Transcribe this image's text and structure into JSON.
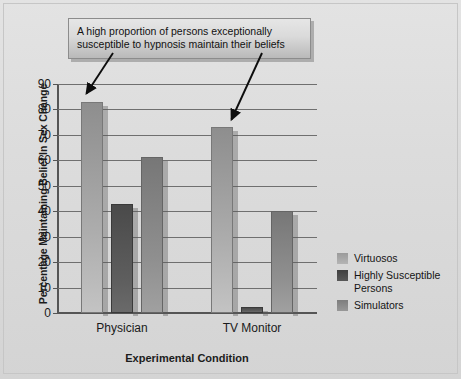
{
  "chart_data": {
    "type": "bar",
    "title": "",
    "categories": [
      "Physician",
      "TV Monitor"
    ],
    "series": [
      {
        "name": "Virtuosos",
        "values": [
          83,
          73
        ],
        "color": "#a8a8a8"
      },
      {
        "name": "Highly Susceptible Persons",
        "values": [
          43,
          2.5
        ],
        "color": "#4d4d4d"
      },
      {
        "name": "Simulators",
        "values": [
          61.5,
          40
        ],
        "color": "#8a8a8a"
      }
    ],
    "xlabel": "Experimental Condition",
    "ylabel": "Percentage Maintaining Belief In Sex Change",
    "ylim": [
      0,
      90
    ],
    "yticks": [
      0,
      10,
      20,
      30,
      40,
      50,
      60,
      70,
      80,
      90
    ],
    "ytick_labels": [
      "0",
      "10",
      "20",
      "30",
      "40",
      "50",
      "60",
      "70",
      "80",
      "90"
    ],
    "grid": true,
    "legend_position": "right",
    "annotations": [
      {
        "name": "callout",
        "lines": [
          "A high proportion of persons exceptionally",
          "susceptible to hypnosis maintain their beliefs"
        ],
        "points_to": [
          "Physician / Virtuosos",
          "TV Monitor / Virtuosos"
        ]
      }
    ]
  },
  "axes": {
    "y_title": "Percentage Maintaining Belief In Sex Change",
    "x_title": "Experimental Condition"
  },
  "legend": {
    "items": [
      {
        "label": "Virtuosos"
      },
      {
        "label": "Highly Susceptible Persons"
      },
      {
        "label": "Simulators"
      }
    ]
  }
}
